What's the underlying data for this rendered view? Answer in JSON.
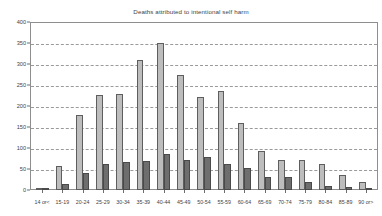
{
  "chart_data": {
    "type": "bar",
    "title": "Deaths attributed to intentional self harm",
    "xlabel": "",
    "ylabel": "",
    "ylim": [
      0,
      400
    ],
    "yticks": [
      0,
      50,
      100,
      150,
      200,
      250,
      300,
      350,
      400
    ],
    "grid": true,
    "legend_position": "top-center",
    "categories": [
      "14 or<",
      "15-19",
      "20-24",
      "25-29",
      "30-34",
      "35-39",
      "40-44",
      "45-49",
      "50-54",
      "55-59",
      "60-64",
      "65-69",
      "70-74",
      "75-79",
      "80-84",
      "85-89",
      "90 or>"
    ],
    "series": [
      {
        "name": "male",
        "color": "#bdbdbd",
        "values": [
          5,
          57,
          178,
          227,
          228,
          310,
          350,
          275,
          222,
          235,
          160,
          92,
          72,
          72,
          63,
          35,
          20
        ]
      },
      {
        "name": "female",
        "color": "#6e6e6e",
        "values": [
          3,
          15,
          40,
          63,
          66,
          70,
          85,
          72,
          78,
          62,
          52,
          32,
          30,
          18,
          10,
          7,
          3
        ]
      }
    ]
  },
  "legend": {
    "items": [
      {
        "label": "male"
      },
      {
        "label": "female"
      }
    ]
  },
  "colors": {
    "male": "#bdbdbd",
    "female": "#6e6e6e",
    "grid": "#9a9a9a",
    "axis": "#8e8e8e",
    "text": "#3f3f3f"
  }
}
